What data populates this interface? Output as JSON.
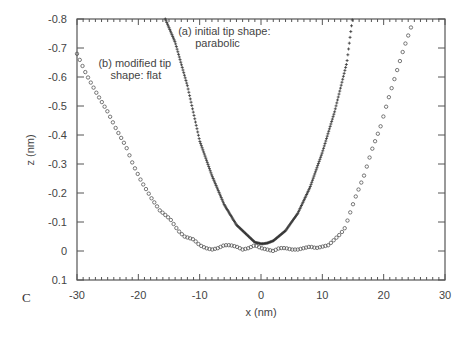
{
  "chart_data": {
    "type": "scatter",
    "title": "",
    "panel_label": "C",
    "xlabel": "x (nm)",
    "ylabel": "z (nm)",
    "xlim": [
      -30,
      30
    ],
    "ylim": [
      0.1,
      -0.8
    ],
    "y_inverted": true,
    "grid": false,
    "legend_position": "annotations",
    "x_ticks": [
      -30,
      -20,
      -10,
      0,
      10,
      20,
      30
    ],
    "x_tick_labels": [
      "-30",
      "-20",
      "-10",
      "0",
      "10",
      "20",
      "30"
    ],
    "x_minor_step": 1,
    "y_ticks": [
      -0.8,
      -0.7,
      -0.6,
      -0.5,
      -0.4,
      -0.3,
      -0.2,
      -0.1,
      0,
      0.1
    ],
    "y_tick_labels": [
      "-0.8",
      "-0.7",
      "-0.6",
      "-0.5",
      "-0.4",
      "-0.3",
      "-0.2",
      "-0.1",
      "0",
      "0.1"
    ],
    "annotations": [
      {
        "id": "a",
        "lines": [
          "(a) initial tip shape:",
          "parabolic"
        ],
        "x": -13.5,
        "y": -0.745
      },
      {
        "id": "b",
        "lines": [
          "(b) modified tip",
          "shape: flat"
        ],
        "x": -26.5,
        "y": -0.635
      }
    ],
    "series": [
      {
        "name": "(a) initial tip shape: parabolic",
        "marker": "plus",
        "color": "#333333",
        "model": "z = -0.025 - 0.0033*(x-0.3)^2",
        "x": [
          -15.6,
          -14,
          -12,
          -10,
          -8,
          -6,
          -4,
          -2,
          -1,
          0,
          0.3,
          1,
          2,
          4,
          6,
          8,
          10,
          12,
          14,
          14.9
        ],
        "values": [
          -0.8,
          -0.72,
          -0.57,
          -0.38,
          -0.26,
          -0.16,
          -0.09,
          -0.05,
          -0.03,
          -0.025,
          -0.025,
          -0.027,
          -0.035,
          -0.07,
          -0.13,
          -0.22,
          -0.34,
          -0.48,
          -0.65,
          -0.8
        ]
      },
      {
        "name": "(b) modified tip shape: flat",
        "marker": "circle",
        "color": "#555555",
        "x": [
          -30,
          -28.5,
          -26.7,
          -25,
          -23.6,
          -22,
          -20.9,
          -19.5,
          -17.8,
          -16.5,
          -14.8,
          -13.5,
          -12.5,
          -11,
          -10,
          -9,
          -8,
          -7,
          -6,
          -5,
          -4,
          -3,
          -2,
          -1,
          0,
          1,
          2,
          3,
          4,
          5,
          6,
          7,
          8,
          9,
          10,
          11,
          12,
          13,
          13.7,
          15.3,
          16.8,
          18.1,
          19.5,
          20.7,
          22,
          23.3,
          24.6
        ],
        "values": [
          -0.68,
          -0.61,
          -0.54,
          -0.48,
          -0.42,
          -0.36,
          -0.3,
          -0.24,
          -0.18,
          -0.14,
          -0.11,
          -0.07,
          -0.05,
          -0.04,
          -0.02,
          -0.01,
          -0.005,
          -0.01,
          -0.02,
          -0.02,
          -0.015,
          -0.005,
          -0.01,
          -0.02,
          -0.01,
          -0.005,
          0.0,
          -0.01,
          -0.01,
          -0.005,
          -0.005,
          -0.01,
          -0.015,
          -0.01,
          -0.015,
          -0.02,
          -0.04,
          -0.06,
          -0.08,
          -0.18,
          -0.26,
          -0.35,
          -0.43,
          -0.52,
          -0.61,
          -0.7,
          -0.78
        ]
      }
    ]
  }
}
